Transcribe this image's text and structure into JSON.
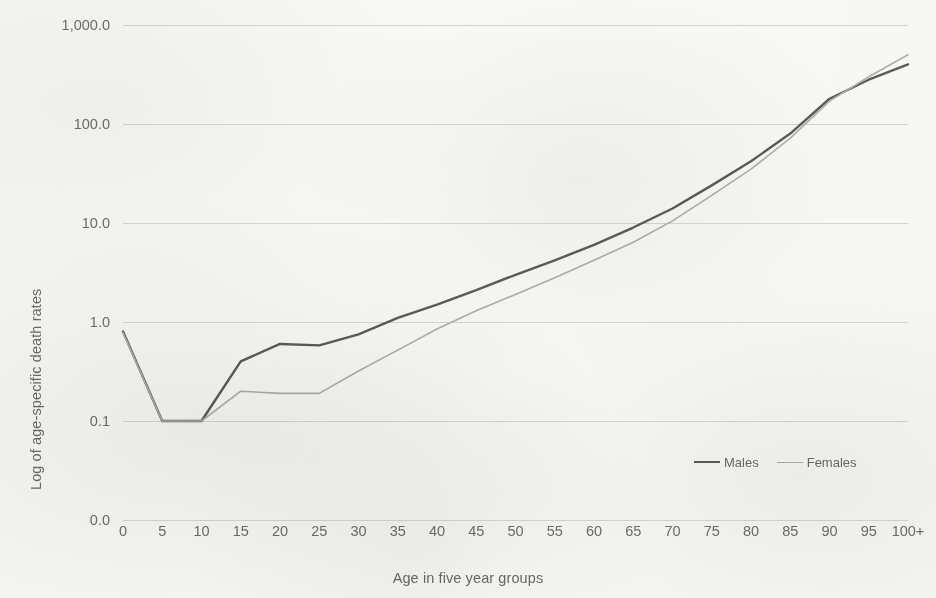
{
  "chart_data": {
    "type": "line",
    "title": "",
    "xlabel": "Age in five year groups",
    "ylabel": "Log of age-specific death rates",
    "yscale": "log",
    "grid": true,
    "legend_position": "bottom-right",
    "categories": [
      "0",
      "5",
      "10",
      "15",
      "20",
      "25",
      "30",
      "35",
      "40",
      "45",
      "50",
      "55",
      "60",
      "65",
      "70",
      "75",
      "80",
      "85",
      "90",
      "95",
      "100+"
    ],
    "ytick_labels": [
      "1,000.0",
      "100.0",
      "10.0",
      "1.0",
      "0.1",
      "0.0"
    ],
    "ytick_values": [
      1000.0,
      100.0,
      10.0,
      1.0,
      0.1,
      0.0
    ],
    "ylim": [
      0.0,
      1000.0
    ],
    "series": [
      {
        "name": "Males",
        "color": "#5c5c5c",
        "values": [
          0.8,
          0.1,
          0.1,
          0.4,
          0.6,
          0.58,
          0.75,
          1.1,
          1.5,
          2.1,
          3.0,
          4.2,
          6.0,
          9.0,
          14.0,
          24.0,
          42.0,
          80.0,
          180.0,
          280.0,
          400.0
        ]
      },
      {
        "name": "Females",
        "color": "#b0b0b0",
        "values": [
          0.78,
          0.1,
          0.1,
          0.2,
          0.19,
          0.19,
          0.32,
          0.52,
          0.85,
          1.3,
          1.9,
          2.8,
          4.2,
          6.4,
          10.5,
          19.0,
          35.0,
          72.0,
          170.0,
          300.0,
          500.0
        ]
      }
    ]
  },
  "legend": {
    "items": [
      {
        "label": "Males",
        "color": "#5c5c5c",
        "width": 2.6
      },
      {
        "label": "Females",
        "color": "#b2b2b2",
        "width": 1.6
      }
    ]
  },
  "style": {
    "background": "#fbfbfa",
    "gridline_color": "#d8d8d6",
    "text_color": "#6b6b6b"
  }
}
